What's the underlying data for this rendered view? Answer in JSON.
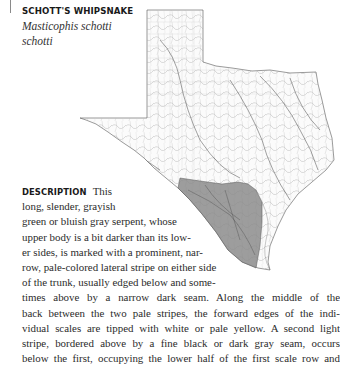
{
  "entry": {
    "common_name": "SCHOTT'S WHIPSNAKE",
    "scientific_name_line1": "Masticophis schotti",
    "scientific_name_line2": "schotti"
  },
  "map": {
    "region": "Texas",
    "range_shading_color": "#8c8c8c",
    "outline_color": "#555555"
  },
  "description": {
    "label": "DESCRIPTION",
    "lines": [
      "This",
      "long,  slender,  grayish",
      "green or bluish gray serpent, whose",
      "upper body is a bit darker than its low-",
      "er sides, is marked with a prominent, nar-",
      "row, pale-colored lateral stripe on either side",
      "of the trunk, usually edged below and some-",
      "times above by a narrow dark seam. Along the middle of the",
      "back between the two pale stripes, the forward edges of the indi-",
      "vidual scales are tipped with white or pale yellow. A second light",
      "stripe, bordered above by a fine black or dark gray seam, occurs",
      "below the first, occupying the lower half of the first scale row and"
    ]
  }
}
